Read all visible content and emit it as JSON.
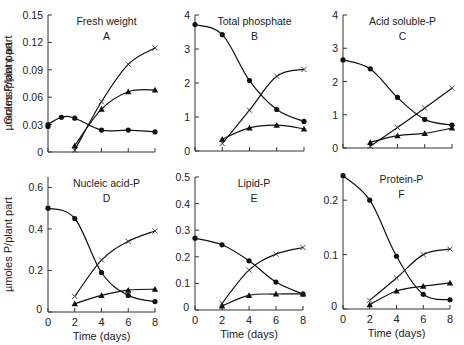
{
  "chart_data": [
    {
      "id": "A",
      "type": "line",
      "title": "Fresh weight",
      "panel_letter": "A",
      "xlabel": "",
      "ylabel": "Grams/plant part",
      "xlim": [
        0,
        8
      ],
      "ylim": [
        0,
        0.15
      ],
      "xticks": [
        0,
        2,
        4,
        6,
        8
      ],
      "xtick_labels": [
        "",
        "",
        "",
        "",
        ""
      ],
      "yticks": [
        0,
        0.03,
        0.06,
        0.09,
        0.12,
        0.15
      ],
      "ytick_labels": [
        "0",
        "0.03",
        "0.06",
        "0.09",
        "0.12",
        "0.15"
      ],
      "frame": {
        "x0": 48,
        "x1": 155,
        "y0": 152,
        "y1": 15
      },
      "series": [
        {
          "marker": "circle",
          "x": [
            0,
            0,
            1,
            2,
            4,
            6,
            8
          ],
          "y": [
            0.028,
            0.03,
            0.038,
            0.037,
            0.024,
            0.024,
            0.022
          ]
        },
        {
          "marker": "cross",
          "x": [
            2,
            4,
            6,
            8
          ],
          "y": [
            0.002,
            0.055,
            0.096,
            0.114
          ]
        },
        {
          "marker": "triangle",
          "x": [
            2,
            4,
            6,
            8
          ],
          "y": [
            0.007,
            0.047,
            0.066,
            0.068
          ]
        }
      ]
    },
    {
      "id": "B",
      "type": "line",
      "title": "Total phosphate",
      "panel_letter": "B",
      "xlabel": "",
      "ylabel": "µmoles P/plant part",
      "xlim": [
        0,
        8
      ],
      "ylim": [
        0,
        4
      ],
      "xticks": [
        0,
        2,
        4,
        6,
        8
      ],
      "xtick_labels": [
        "",
        "",
        "",
        "",
        ""
      ],
      "yticks": [
        0,
        1,
        2,
        3,
        4
      ],
      "ytick_labels": [
        "0",
        "1",
        "2",
        "3",
        "4"
      ],
      "frame": {
        "x0": 195,
        "x1": 304,
        "y0": 151,
        "y1": 15
      },
      "series": [
        {
          "marker": "circle",
          "x": [
            0,
            2,
            4,
            6,
            8
          ],
          "y": [
            3.72,
            3.42,
            2.07,
            1.22,
            0.87
          ]
        },
        {
          "marker": "cross",
          "x": [
            2,
            4,
            6,
            8
          ],
          "y": [
            0.22,
            1.2,
            2.2,
            2.4
          ]
        },
        {
          "marker": "triangle",
          "x": [
            2,
            4,
            6,
            8
          ],
          "y": [
            0.35,
            0.68,
            0.76,
            0.65
          ]
        }
      ]
    },
    {
      "id": "C",
      "type": "line",
      "title": "Acid soluble-P",
      "panel_letter": "C",
      "xlabel": "",
      "ylabel": "",
      "xlim": [
        0,
        8
      ],
      "ylim": [
        0,
        4
      ],
      "xticks": [
        0,
        2,
        4,
        6,
        8
      ],
      "xtick_labels": [
        "",
        "",
        "",
        "",
        ""
      ],
      "yticks": [
        0,
        1,
        2,
        3,
        4
      ],
      "ytick_labels": [
        "0",
        "1",
        "2",
        "3",
        "4"
      ],
      "frame": {
        "x0": 343,
        "x1": 452,
        "y0": 148,
        "y1": 15
      },
      "series": [
        {
          "marker": "circle",
          "x": [
            0,
            2,
            4,
            6,
            8
          ],
          "y": [
            2.65,
            2.38,
            1.52,
            0.86,
            0.69
          ]
        },
        {
          "marker": "cross",
          "x": [
            2,
            4,
            6,
            8
          ],
          "y": [
            0.05,
            0.62,
            1.2,
            1.8
          ]
        },
        {
          "marker": "triangle",
          "x": [
            2,
            4,
            6,
            8
          ],
          "y": [
            0.17,
            0.37,
            0.44,
            0.6
          ]
        }
      ]
    },
    {
      "id": "D",
      "type": "line",
      "title": "Nucleic acid-P",
      "panel_letter": "D",
      "xlabel": "Time (days)",
      "ylabel": "µmoles P/plant part",
      "xlim": [
        0,
        8
      ],
      "ylim": [
        0,
        0.65
      ],
      "xticks": [
        0,
        2,
        4,
        6,
        8
      ],
      "xtick_labels": [
        "0",
        "2",
        "4",
        "6",
        "8"
      ],
      "yticks": [
        0,
        0.2,
        0.4,
        0.6
      ],
      "ytick_labels": [
        "0",
        "0.2",
        "0.4",
        "0.6"
      ],
      "frame": {
        "x0": 48,
        "x1": 155,
        "y0": 312,
        "y1": 177
      },
      "series": [
        {
          "marker": "circle",
          "x": [
            0,
            2,
            4,
            6,
            8
          ],
          "y": [
            0.5,
            0.45,
            0.19,
            0.08,
            0.05
          ]
        },
        {
          "marker": "cross",
          "x": [
            2,
            4,
            6,
            8
          ],
          "y": [
            0.075,
            0.25,
            0.34,
            0.39
          ]
        },
        {
          "marker": "triangle",
          "x": [
            2,
            4,
            6,
            8
          ],
          "y": [
            0.04,
            0.08,
            0.105,
            0.11
          ]
        }
      ]
    },
    {
      "id": "E",
      "type": "line",
      "title": "Lipid-P",
      "panel_letter": "E",
      "xlabel": "Time (days)",
      "ylabel": "",
      "xlim": [
        0,
        8
      ],
      "ylim": [
        0,
        0.5
      ],
      "xticks": [
        0,
        2,
        4,
        6,
        8
      ],
      "xtick_labels": [
        "0",
        "2",
        "4",
        "6",
        "8"
      ],
      "yticks": [
        0,
        0.1,
        0.2,
        0.3,
        0.4,
        0.5
      ],
      "ytick_labels": [
        "0",
        "0.1",
        "0.2",
        "0.3",
        "0.4",
        "0.5"
      ],
      "frame": {
        "x0": 195,
        "x1": 303,
        "y0": 310,
        "y1": 177
      },
      "series": [
        {
          "marker": "circle",
          "x": [
            0,
            2,
            4,
            6,
            8
          ],
          "y": [
            0.27,
            0.245,
            0.185,
            0.105,
            0.06
          ]
        },
        {
          "marker": "cross",
          "x": [
            2,
            4,
            6,
            8
          ],
          "y": [
            0.025,
            0.15,
            0.21,
            0.235
          ]
        },
        {
          "marker": "triangle",
          "x": [
            2,
            4,
            6,
            8
          ],
          "y": [
            0.015,
            0.055,
            0.06,
            0.06
          ]
        }
      ]
    },
    {
      "id": "F",
      "type": "line",
      "title": "Protein-P",
      "panel_letter": "F",
      "xlabel": "Time (days)",
      "ylabel": "",
      "xlim": [
        0,
        8
      ],
      "ylim": [
        0,
        0.25
      ],
      "xticks": [
        0,
        2,
        4,
        6,
        8
      ],
      "xtick_labels": [
        "0",
        "2",
        "4",
        "6",
        "8"
      ],
      "yticks": [
        0,
        0.1,
        0.2
      ],
      "ytick_labels": [
        "0",
        "0.1",
        "0.2"
      ],
      "frame": {
        "x0": 343,
        "x1": 450,
        "y0": 309,
        "y1": 173
      },
      "series": [
        {
          "marker": "circle",
          "x": [
            0,
            2,
            4,
            6,
            8
          ],
          "y": [
            0.245,
            0.2,
            0.097,
            0.027,
            0.017
          ]
        },
        {
          "marker": "cross",
          "x": [
            2,
            4,
            6,
            8
          ],
          "y": [
            0.016,
            0.057,
            0.1,
            0.11
          ]
        },
        {
          "marker": "triangle",
          "x": [
            2,
            4,
            6,
            8
          ],
          "y": [
            0.008,
            0.033,
            0.042,
            0.048
          ]
        }
      ]
    }
  ]
}
